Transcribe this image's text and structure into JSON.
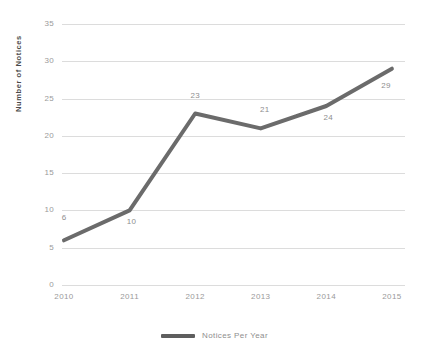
{
  "chart_data": {
    "type": "line",
    "title": "",
    "subtitle": "",
    "xlabel": "",
    "ylabel": "Number of Notices",
    "categories": [
      "2010",
      "2011",
      "2012",
      "2013",
      "2014",
      "2015"
    ],
    "series": [
      {
        "name": "Notices Per Year",
        "values": [
          6,
          10,
          23,
          21,
          24,
          29
        ],
        "color": "#6b6b6b"
      }
    ],
    "point_labels": [
      "6",
      "10",
      "23",
      "21",
      "24",
      "29"
    ],
    "ylim": [
      0,
      35
    ],
    "ytick_values": [
      0,
      5,
      10,
      15,
      20,
      25,
      30,
      35
    ],
    "ytick_labels": [
      "0",
      "5",
      "10",
      "15",
      "20",
      "25",
      "30",
      "35"
    ],
    "grid": true,
    "grid_axis": "y",
    "legend_position": "bottom",
    "colors": {
      "line": "#6b6b6b",
      "grid": "#dcdcdc",
      "tick_text": "#9a9a9a",
      "axis_title": "#4a4a4a",
      "data_label": "#8e8e8e",
      "background": "#ffffff"
    }
  },
  "legend": {
    "entries": [
      {
        "label": "Notices Per Year",
        "swatch": "line-swatch-icon"
      }
    ]
  }
}
